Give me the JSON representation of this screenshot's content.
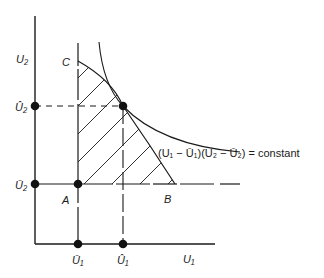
{
  "diagram": {
    "type": "Nash bargaining diagram",
    "axes": {
      "x_label": "U₁",
      "y_label": "U₂"
    },
    "y_axis_points": [
      {
        "label": "Û₂",
        "role": "solution utility of player 2"
      },
      {
        "label": "Ū₂",
        "role": "disagreement utility of player 2"
      }
    ],
    "x_axis_points": [
      {
        "label": "Ū₁",
        "role": "disagreement utility of player 1"
      },
      {
        "label": "Û₁",
        "role": "solution utility of player 1"
      }
    ],
    "point_labels": {
      "A": "A",
      "B": "B",
      "C": "C"
    },
    "curve_equation": "(U₁ − Ū₁)(U₂ − Ū₂) = constant",
    "colors": {
      "line": "#1a1a1a",
      "background": "#ffffff"
    }
  }
}
